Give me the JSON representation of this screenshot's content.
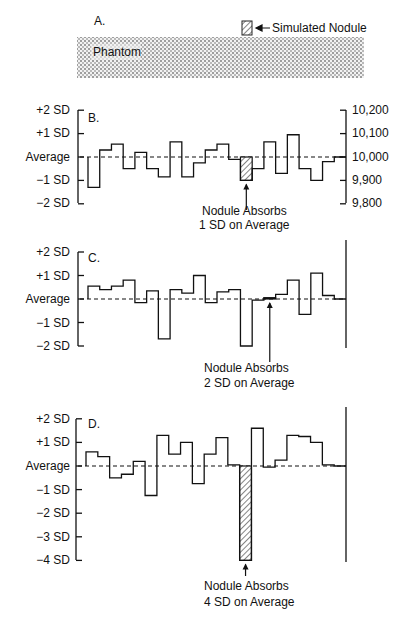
{
  "panel_a": {
    "label": "A.",
    "phantom_label": "Phantom",
    "nodule_label": "Simulated Nodule"
  },
  "panel_b": {
    "label": "B.",
    "left_ticks": [
      "+2 SD",
      "+1 SD",
      "Average",
      "−1 SD",
      "−2 SD"
    ],
    "right_ticks": [
      "10,200",
      "10,100",
      "10,000",
      "9,900",
      "9,800"
    ],
    "annotation_line1": "Nodule Absorbs",
    "annotation_line2": "1 SD on Average"
  },
  "panel_c": {
    "label": "C.",
    "left_ticks": [
      "+2 SD",
      "+1 SD",
      "Average",
      "−1 SD",
      "−2 SD"
    ],
    "annotation_line1": "Nodule Absorbs",
    "annotation_line2": "2 SD on Average"
  },
  "panel_d": {
    "label": "D.",
    "left_ticks": [
      "+2 SD",
      "+1 SD",
      "Average",
      "−1 SD",
      "−2 SD",
      "−3 SD",
      "−4 SD"
    ],
    "annotation_line1": "Nodule Absorbs",
    "annotation_line2": "4 SD on Average"
  },
  "chart_data": [
    {
      "type": "step",
      "title": "B.",
      "ylabel": "Deviation from average (SD)",
      "ylabel_right": "Counts",
      "ylim": [
        -2,
        2
      ],
      "ylim_right": [
        9800,
        10200
      ],
      "nodule_index": 13,
      "values": [
        -1.3,
        0.3,
        0.55,
        -0.5,
        0.2,
        -0.5,
        -0.85,
        0.65,
        -0.85,
        -0.25,
        0.3,
        0.55,
        -0.1,
        -1.0,
        -0.5,
        0.65,
        -0.7,
        0.95,
        -0.5,
        -1.0,
        -0.2,
        0.0
      ],
      "annotation": "Nodule Absorbs 1 SD on Average"
    },
    {
      "type": "step",
      "title": "C.",
      "ylim": [
        -2,
        2
      ],
      "nodule_index": 15,
      "values": [
        0.55,
        0.4,
        0.55,
        0.8,
        -0.15,
        0.35,
        -1.7,
        0.4,
        0.25,
        1.0,
        -0.15,
        0.3,
        0.4,
        -2.0,
        -0.05,
        0.05,
        0.2,
        0.8,
        -0.65,
        1.1,
        0.15,
        0.0
      ],
      "annotation": "Nodule Absorbs 2 SD on Average"
    },
    {
      "type": "step",
      "title": "D.",
      "ylim": [
        -4,
        2
      ],
      "nodule_index": 13,
      "values": [
        0.6,
        0.4,
        -0.5,
        -0.35,
        0.2,
        -1.25,
        1.3,
        0.5,
        1.0,
        -0.75,
        0.5,
        1.2,
        0.05,
        -4.0,
        1.6,
        -0.05,
        0.25,
        1.3,
        1.25,
        1.0,
        0.05,
        0.0
      ],
      "annotation": "Nodule Absorbs 4 SD on Average"
    }
  ]
}
